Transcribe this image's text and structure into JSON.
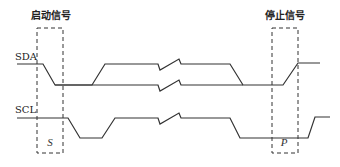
{
  "diagram": {
    "start_box": {
      "title": "启动信号",
      "marker": "S"
    },
    "stop_box": {
      "title": "停止信号",
      "marker": "P"
    },
    "signals": [
      {
        "name": "SDA"
      },
      {
        "name": "SCL"
      }
    ],
    "colors": {
      "line": "#333333",
      "background": "#ffffff"
    }
  }
}
